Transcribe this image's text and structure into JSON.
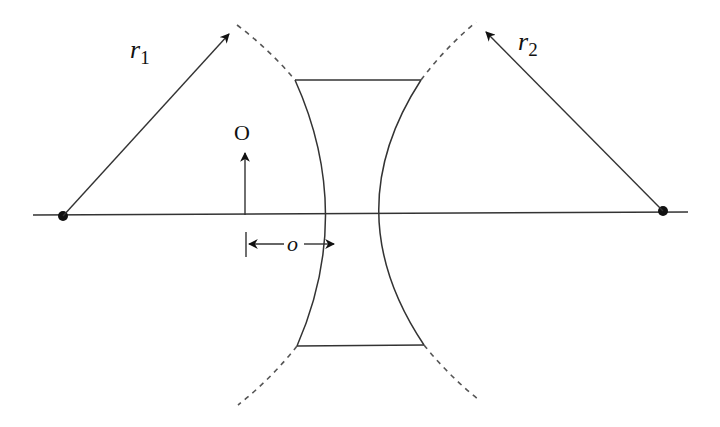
{
  "figure": {
    "type": "optics-diagram",
    "colors": {
      "line": "#333333",
      "dashed": "#555555",
      "background": "#ffffff",
      "ink": "#111111"
    }
  },
  "labels": {
    "r1_main": "r",
    "r1_sub": "1",
    "r2_main": "r",
    "r2_sub": "2",
    "object": "O",
    "object_distance": "o"
  },
  "elements": {
    "optical_axis": {
      "x1": 33,
      "y1": 215,
      "x2": 688,
      "y2": 212
    },
    "center_left": {
      "cx": 63,
      "cy": 216,
      "r": 5
    },
    "center_right": {
      "cx": 663,
      "cy": 211,
      "r": 5
    },
    "radius_r1": {
      "x1": 63,
      "y1": 216,
      "x2": 230,
      "y2": 33
    },
    "radius_r2": {
      "x1": 663,
      "y1": 211,
      "x2": 485,
      "y2": 31
    },
    "object_arrow": {
      "x": 245,
      "y_base": 215,
      "y_tip": 152
    },
    "lens_top_edge": {
      "x1": 295,
      "y1": 80,
      "x2": 421,
      "y2": 80
    },
    "lens_bottom_edge": {
      "x1": 297,
      "y1": 346,
      "x2": 424,
      "y2": 345
    }
  }
}
